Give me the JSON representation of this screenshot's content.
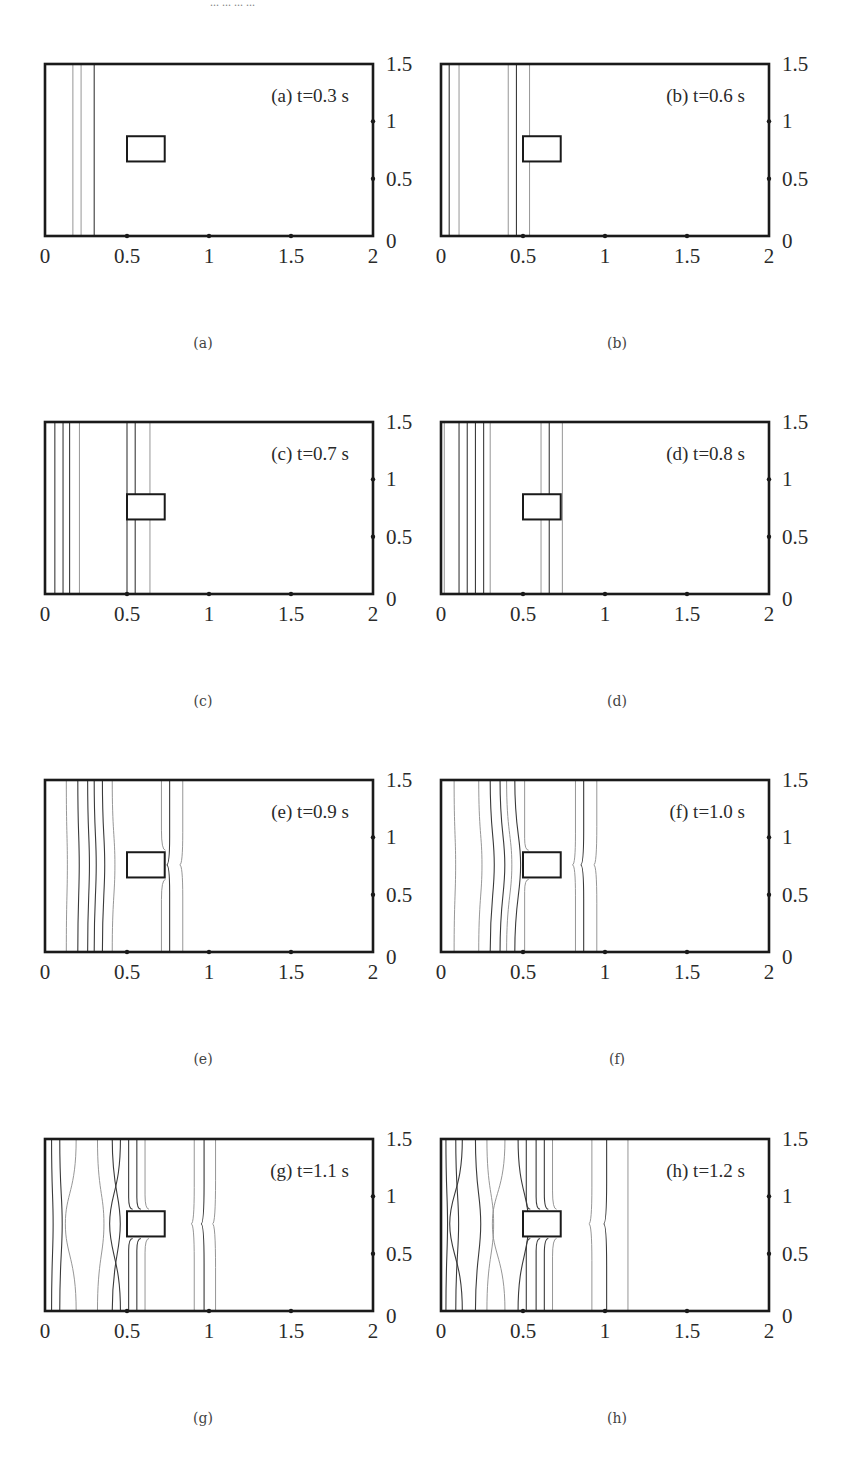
{
  "header_fragment": "... ... ... ...",
  "chart_data": {
    "type": "contour",
    "xlim": [
      0,
      2
    ],
    "ylim": [
      0,
      1.5
    ],
    "xticks": [
      "0",
      "0.5",
      "1",
      "1.5",
      "2"
    ],
    "yticks": [
      "0",
      "0.5",
      "1",
      "1.5"
    ],
    "obstacle": {
      "x0": 0.5,
      "x1": 0.73,
      "y0": 0.65,
      "y1": 0.87
    },
    "panels": [
      {
        "id": "a",
        "annotation": "(a) t=0.3 s",
        "caption": "(a)",
        "t": 0.3,
        "contours": [
          {
            "x": 0.17,
            "style": "light"
          },
          {
            "x": 0.22,
            "style": "light"
          },
          {
            "x": 0.3,
            "style": "dark"
          }
        ]
      },
      {
        "id": "b",
        "annotation": "(b) t=0.6 s",
        "caption": "(b)",
        "t": 0.6,
        "contours": [
          {
            "x": 0.05,
            "style": "dark"
          },
          {
            "x": 0.11,
            "style": "light"
          },
          {
            "x": 0.41,
            "style": "light"
          },
          {
            "x": 0.46,
            "style": "dark"
          },
          {
            "x": 0.54,
            "style": "light"
          }
        ]
      },
      {
        "id": "c",
        "annotation": "(c) t=0.7 s",
        "caption": "(c)",
        "t": 0.7,
        "contours": [
          {
            "x": 0.06,
            "style": "dark"
          },
          {
            "x": 0.11,
            "style": "dark"
          },
          {
            "x": 0.15,
            "style": "dark"
          },
          {
            "x": 0.21,
            "style": "light"
          },
          {
            "x": 0.5,
            "style": "dark"
          },
          {
            "x": 0.55,
            "style": "dark"
          },
          {
            "x": 0.64,
            "style": "light"
          }
        ]
      },
      {
        "id": "d",
        "annotation": "(d) t=0.8 s",
        "caption": "(d)",
        "t": 0.8,
        "contours": [
          {
            "x": 0.02,
            "style": "light"
          },
          {
            "x": 0.11,
            "style": "dark"
          },
          {
            "x": 0.16,
            "style": "dark"
          },
          {
            "x": 0.21,
            "style": "dark"
          },
          {
            "x": 0.26,
            "style": "dark"
          },
          {
            "x": 0.3,
            "style": "light"
          },
          {
            "x": 0.61,
            "style": "light"
          },
          {
            "x": 0.66,
            "style": "dark"
          },
          {
            "x": 0.74,
            "style": "light"
          }
        ]
      },
      {
        "id": "e",
        "annotation": "(e) t=0.9 s",
        "caption": "(e)",
        "t": 0.9,
        "contours": [
          {
            "x": 0.13,
            "style": "light"
          },
          {
            "x": 0.2,
            "style": "dark"
          },
          {
            "x": 0.26,
            "style": "dark"
          },
          {
            "x": 0.3,
            "style": "dark"
          },
          {
            "x": 0.35,
            "style": "dark"
          },
          {
            "x": 0.41,
            "style": "light"
          },
          {
            "x": 0.71,
            "style": "light"
          },
          {
            "x": 0.76,
            "style": "dark"
          },
          {
            "x": 0.84,
            "style": "light"
          }
        ]
      },
      {
        "id": "f",
        "annotation": "(f) t=1.0 s",
        "caption": "(f)",
        "t": 1.0,
        "contours": [
          {
            "x": 0.08,
            "style": "light"
          },
          {
            "x": 0.23,
            "style": "light"
          },
          {
            "x": 0.3,
            "style": "dark"
          },
          {
            "x": 0.36,
            "style": "dark"
          },
          {
            "x": 0.4,
            "style": "light"
          },
          {
            "x": 0.45,
            "style": "dark"
          },
          {
            "x": 0.51,
            "style": "light"
          },
          {
            "x": 0.82,
            "style": "light"
          },
          {
            "x": 0.87,
            "style": "dark"
          },
          {
            "x": 0.95,
            "style": "light"
          }
        ]
      },
      {
        "id": "g",
        "annotation": "(g) t=1.1 s",
        "caption": "(g)",
        "t": 1.1,
        "contours": [
          {
            "x": 0.04,
            "style": "dark"
          },
          {
            "x": 0.09,
            "style": "dark"
          },
          {
            "x": 0.19,
            "style": "light"
          },
          {
            "x": 0.32,
            "style": "light"
          },
          {
            "x": 0.41,
            "style": "dark"
          },
          {
            "x": 0.46,
            "style": "dark"
          },
          {
            "x": 0.51,
            "style": "dark"
          },
          {
            "x": 0.56,
            "style": "dark"
          },
          {
            "x": 0.61,
            "style": "light"
          },
          {
            "x": 0.91,
            "style": "light"
          },
          {
            "x": 0.97,
            "style": "dark"
          },
          {
            "x": 1.04,
            "style": "light"
          }
        ]
      },
      {
        "id": "h",
        "annotation": "(h) t=1.2 s",
        "caption": "(h)",
        "t": 1.2,
        "contours": [
          {
            "x": 0.03,
            "style": "dark"
          },
          {
            "x": 0.09,
            "style": "dark"
          },
          {
            "x": 0.13,
            "style": "dark"
          },
          {
            "x": 0.21,
            "style": "dark"
          },
          {
            "x": 0.28,
            "style": "light"
          },
          {
            "x": 0.39,
            "style": "light"
          },
          {
            "x": 0.47,
            "style": "dark"
          },
          {
            "x": 0.52,
            "style": "dark"
          },
          {
            "x": 0.58,
            "style": "dark"
          },
          {
            "x": 0.63,
            "style": "dark"
          },
          {
            "x": 0.68,
            "style": "light"
          },
          {
            "x": 0.92,
            "style": "light"
          },
          {
            "x": 1.01,
            "style": "dark"
          },
          {
            "x": 1.14,
            "style": "light"
          }
        ]
      }
    ],
    "grid": false,
    "legend": "none",
    "xlabel": "",
    "ylabel": ""
  },
  "layout": {
    "columns_left": [
      45,
      441
    ],
    "rows_top": [
      64,
      422,
      780,
      1139
    ],
    "plot_w": 328,
    "plot_h": 172,
    "caption_offset": 112
  }
}
